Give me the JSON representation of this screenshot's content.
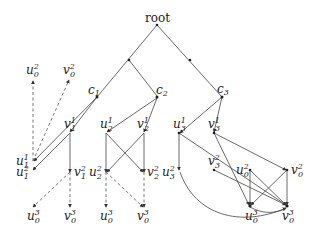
{
  "diagram": {
    "title": "",
    "root_label": "root",
    "clusters": [
      {
        "id": "c1",
        "label": "c",
        "sub": "1"
      },
      {
        "id": "c2",
        "label": "c",
        "sub": "2"
      },
      {
        "id": "c3",
        "label": "c",
        "sub": "3"
      }
    ],
    "nodes": [
      {
        "id": "u02_top",
        "base": "u",
        "sub": "0",
        "sup": "2"
      },
      {
        "id": "v02_top",
        "base": "v",
        "sub": "0",
        "sup": "2"
      },
      {
        "id": "u11",
        "base": "u",
        "sub": "1",
        "sup": "1"
      },
      {
        "id": "v11",
        "base": "v",
        "sub": "1",
        "sup": "1"
      },
      {
        "id": "u12",
        "base": "u",
        "sub": "1",
        "sup": "2"
      },
      {
        "id": "v12",
        "base": "v",
        "sub": "1",
        "sup": "2"
      },
      {
        "id": "u03_a",
        "base": "u",
        "sub": "0",
        "sup": "3"
      },
      {
        "id": "v03_a",
        "base": "v",
        "sub": "0",
        "sup": "3"
      },
      {
        "id": "u21",
        "base": "u",
        "sub": "2",
        "sup": "1"
      },
      {
        "id": "v21",
        "base": "v",
        "sub": "2",
        "sup": "1"
      },
      {
        "id": "u22",
        "base": "u",
        "sub": "2",
        "sup": "2"
      },
      {
        "id": "v22",
        "base": "v",
        "sub": "2",
        "sup": "2"
      },
      {
        "id": "u03_b",
        "base": "u",
        "sub": "0",
        "sup": "3"
      },
      {
        "id": "v03_b",
        "base": "v",
        "sub": "0",
        "sup": "3"
      },
      {
        "id": "u31",
        "base": "u",
        "sub": "3",
        "sup": "1"
      },
      {
        "id": "v31",
        "base": "v",
        "sub": "3",
        "sup": "1"
      },
      {
        "id": "u32",
        "base": "u",
        "sub": "3",
        "sup": "2"
      },
      {
        "id": "v32",
        "base": "v",
        "sub": "3",
        "sup": "2"
      },
      {
        "id": "u02_c",
        "base": "u",
        "sub": "0",
        "sup": "2"
      },
      {
        "id": "v02_c",
        "base": "v",
        "sub": "0",
        "sup": "2"
      },
      {
        "id": "u03_c",
        "base": "u",
        "sub": "0",
        "sup": "3"
      },
      {
        "id": "v03_c",
        "base": "v",
        "sub": "0",
        "sup": "3"
      }
    ],
    "edges": [
      {
        "from": "root",
        "to": "c1",
        "style": "solid"
      },
      {
        "from": "root",
        "to": "c3",
        "style": "solid"
      },
      {
        "from": "mid_left",
        "to": "c2",
        "style": "solid"
      },
      {
        "from": "c1",
        "to": "u11",
        "style": "solid"
      },
      {
        "from": "c1",
        "to": "v11",
        "style": "solid"
      },
      {
        "from": "u11",
        "to": "u02_top",
        "style": "dashed"
      },
      {
        "from": "u11",
        "to": "v02_top",
        "style": "dashed"
      },
      {
        "from": "v11",
        "to": "u12",
        "style": "solid"
      },
      {
        "from": "v11",
        "to": "v12",
        "style": "solid"
      },
      {
        "from": "v12",
        "to": "u03_a",
        "style": "dashed"
      },
      {
        "from": "v12",
        "to": "v03_a",
        "style": "dashed"
      },
      {
        "from": "c2",
        "to": "u21",
        "style": "solid"
      },
      {
        "from": "c2",
        "to": "v21",
        "style": "solid"
      },
      {
        "from": "u21",
        "to": "u22",
        "style": "solid"
      },
      {
        "from": "u21",
        "to": "v22",
        "style": "solid"
      },
      {
        "from": "v21",
        "to": "u22",
        "style": "solid"
      },
      {
        "from": "v21",
        "to": "v22",
        "style": "solid"
      },
      {
        "from": "u22",
        "to": "u03_b",
        "style": "dashed"
      },
      {
        "from": "u22",
        "to": "v03_b",
        "style": "dashed"
      },
      {
        "from": "v22",
        "to": "v03_b",
        "style": "dashed"
      },
      {
        "from": "c3",
        "to": "u31",
        "style": "solid"
      },
      {
        "from": "c3",
        "to": "v31",
        "style": "solid"
      },
      {
        "from": "u31",
        "to": "u32",
        "style": "solid"
      },
      {
        "from": "u31",
        "to": "v03_c",
        "style": "solid"
      },
      {
        "from": "v31",
        "to": "u03_c",
        "style": "solid"
      },
      {
        "from": "v31",
        "to": "v02_c",
        "style": "solid"
      },
      {
        "from": "v32",
        "to": "v03_c",
        "style": "solid"
      },
      {
        "from": "u02_c",
        "to": "u03_c",
        "style": "solid"
      },
      {
        "from": "u02_c",
        "to": "v03_c",
        "style": "solid"
      },
      {
        "from": "v02_c",
        "to": "u03_c",
        "style": "solid"
      },
      {
        "from": "v02_c",
        "to": "v03_c",
        "style": "solid"
      },
      {
        "from": "u32",
        "to": "v03_c",
        "style": "curved"
      },
      {
        "from": "u03_c",
        "to": "v03_c",
        "style": "curved"
      }
    ]
  }
}
